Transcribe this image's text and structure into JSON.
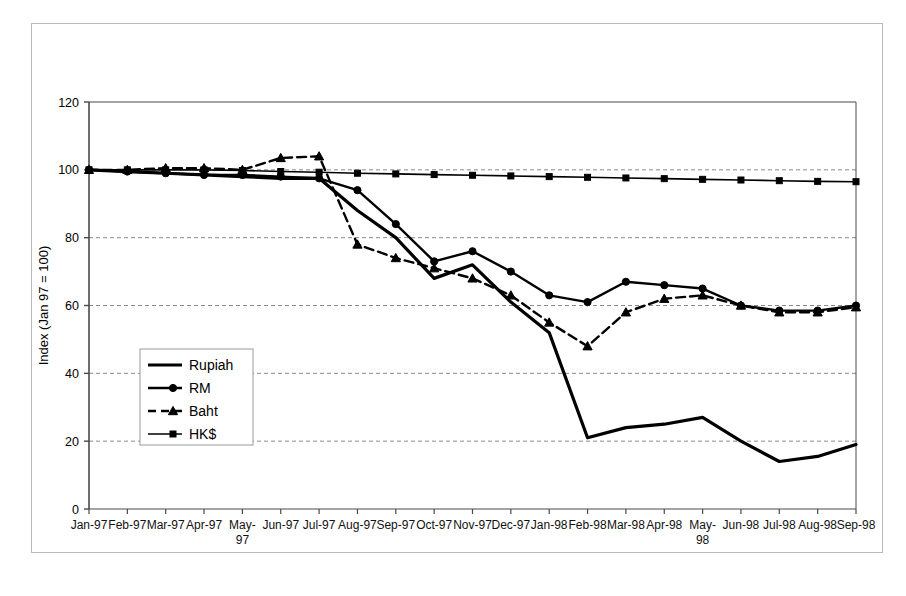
{
  "chart_data": {
    "type": "line",
    "title": "",
    "xlabel": "",
    "ylabel": "Index (Jan 97 = 100)",
    "ylim": [
      0,
      120
    ],
    "ytick_values": [
      0,
      20,
      40,
      60,
      80,
      100,
      120
    ],
    "ytick_labels": [
      "0",
      "20",
      "40",
      "60",
      "80",
      "100",
      "120"
    ],
    "grid": "horizontal-dashed",
    "legend_position": "inside-left-lower",
    "categories": [
      "Jan-97",
      "Feb-97",
      "Mar-97",
      "Apr-97",
      "May-97",
      "Jun-97",
      "Jul-97",
      "Aug-97",
      "Sep-97",
      "Oct-97",
      "Nov-97",
      "Dec-97",
      "Jan-98",
      "Feb-98",
      "Mar-98",
      "Apr-98",
      "May-98",
      "Jun-98",
      "Jul-98",
      "Aug-98",
      "Sep-98"
    ],
    "category_labels_wrapped": {
      "May-97": [
        "May-",
        "97"
      ],
      "May-98": [
        "May-",
        "98"
      ]
    },
    "series": [
      {
        "name": "Rupiah",
        "style": "solid",
        "marker": "none",
        "linewidth": 3.2,
        "values": [
          100,
          99.5,
          99,
          98.5,
          98,
          97.5,
          97.5,
          88,
          80,
          68,
          72,
          61,
          52,
          21,
          24,
          25,
          27,
          20,
          14,
          15.5,
          19
        ]
      },
      {
        "name": "RM",
        "style": "solid",
        "marker": "circle",
        "linewidth": 2.4,
        "values": [
          100,
          99.5,
          99,
          98.5,
          98.5,
          98,
          97.5,
          94,
          84,
          73,
          76,
          70,
          63,
          61,
          67,
          66,
          65,
          60,
          58.5,
          58.5,
          60
        ]
      },
      {
        "name": "Baht",
        "style": "dashed",
        "marker": "triangle",
        "linewidth": 2.4,
        "values": [
          100,
          100,
          100.5,
          100.5,
          100,
          103.5,
          104,
          78,
          74,
          71,
          68,
          63,
          55,
          48,
          58,
          62,
          63,
          60,
          58,
          58,
          59.5
        ]
      },
      {
        "name": "HK$",
        "style": "solid",
        "marker": "square",
        "linewidth": 1.6,
        "values": [
          100,
          100,
          100,
          100,
          99.8,
          99.5,
          99.3,
          99,
          98.8,
          98.6,
          98.4,
          98.2,
          98,
          97.8,
          97.6,
          97.4,
          97.2,
          97,
          96.8,
          96.6,
          96.5
        ]
      }
    ],
    "colors": {
      "line": "#000000",
      "grid": "#8a8a8a",
      "axis": "#4a4a4a",
      "frame": "#b9b9b9",
      "background": "#ffffff"
    }
  },
  "legend": {
    "entries": [
      {
        "label": "Rupiah"
      },
      {
        "label": "RM"
      },
      {
        "label": "Baht"
      },
      {
        "label": "HK$"
      }
    ]
  }
}
